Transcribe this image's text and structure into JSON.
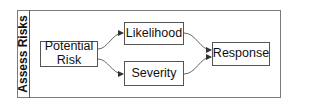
{
  "diagram": {
    "lane": {
      "title": "Assess Risks"
    },
    "nodes": [
      {
        "id": "potential-risk",
        "label": "Potential Risk"
      },
      {
        "id": "likelihood",
        "label": "Likelihood"
      },
      {
        "id": "severity",
        "label": "Severity"
      },
      {
        "id": "response",
        "label": "Response"
      }
    ],
    "edges": [
      {
        "from": "potential-risk",
        "to": "likelihood"
      },
      {
        "from": "potential-risk",
        "to": "severity"
      },
      {
        "from": "likelihood",
        "to": "response"
      },
      {
        "from": "severity",
        "to": "response"
      }
    ],
    "colors": {
      "border": "#555555",
      "edge": "#666666",
      "frame": "#7a7a7a"
    }
  }
}
